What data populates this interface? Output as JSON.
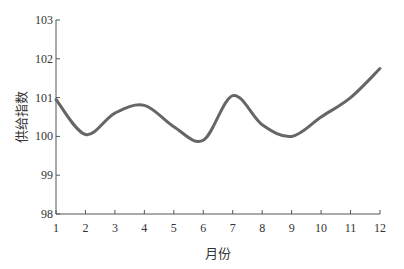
{
  "chart_data": {
    "type": "line",
    "title": "",
    "xlabel": "月份",
    "ylabel": "供给指数",
    "x": [
      1,
      2,
      3,
      4,
      5,
      6,
      7,
      8,
      9,
      10,
      11,
      12
    ],
    "series": [
      {
        "name": "供给指数",
        "values": [
          100.95,
          100.05,
          100.6,
          100.8,
          100.25,
          99.9,
          101.05,
          100.3,
          100.0,
          100.5,
          101.0,
          101.75
        ],
        "color": "#666666"
      }
    ],
    "xticks": [
      "1",
      "2",
      "3",
      "4",
      "5",
      "6",
      "7",
      "8",
      "9",
      "10",
      "11",
      "12"
    ],
    "yticks": [
      "98",
      "99",
      "100",
      "101",
      "102",
      "103"
    ],
    "ylim": [
      98,
      103
    ],
    "xlim": [
      1,
      12
    ],
    "grid": false,
    "legend": "none"
  }
}
